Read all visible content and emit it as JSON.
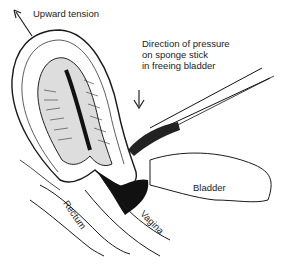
{
  "diagram": {
    "labels": {
      "upward_tension": "Upward tension",
      "pressure_line1": "Direction of pressure",
      "pressure_line2": "on sponge stick",
      "pressure_line3": "in freeing bladder",
      "bladder": "Bladder",
      "vagina": "Vagina",
      "rectum": "Rectum"
    },
    "colors": {
      "ink": "#1a1a1a",
      "background": "#ffffff"
    }
  }
}
